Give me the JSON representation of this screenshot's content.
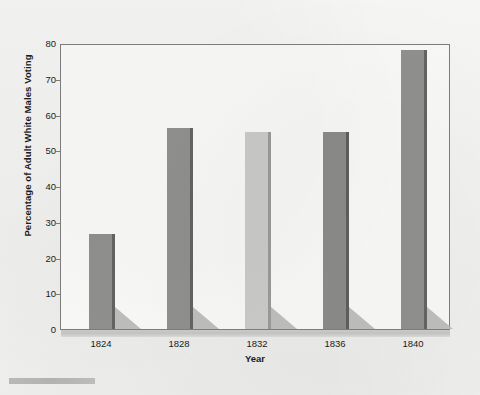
{
  "chart_data": {
    "type": "bar",
    "title": "",
    "xlabel": "Year",
    "ylabel": "Percentage of Adult White Males Voting",
    "categories": [
      "1824",
      "1828",
      "1832",
      "1836",
      "1840"
    ],
    "values": [
      26.5,
      56.3,
      55.0,
      55.2,
      78.0
    ],
    "ylim": [
      0,
      80
    ],
    "yticks": [
      0,
      10,
      20,
      30,
      40,
      50,
      60,
      70,
      80
    ],
    "ytick_labels": [
      "0",
      "10",
      "20",
      "30",
      "40",
      "50",
      "60",
      "70",
      "80"
    ],
    "grid": false,
    "legend": "none",
    "bar_colors": [
      "#8f8f8d",
      "#8f8f8d",
      "#c9c9c7",
      "#8a8a88",
      "#8f8f8d"
    ],
    "bar_edge_colors": [
      "#636361",
      "#636361",
      "#9a9a98",
      "#5e5e5c",
      "#636361"
    ],
    "shadow_color": "#b9b9b7",
    "frame_color": "#7c7c7c",
    "plot_background": "#f7f7f5",
    "page_background": "#f3f3f1",
    "text_color": "#1b1b1b"
  },
  "axes": {
    "y_title": "Percentage of Adult White Males Voting",
    "x_title": "Year"
  }
}
